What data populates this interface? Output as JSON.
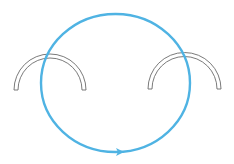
{
  "diagram": {
    "type": "physics-field-loop",
    "colors": {
      "background": "#ffffff",
      "loop": "#4fb3e3",
      "conductor_stroke": "#6b6b6b",
      "conductor_fill": "#ffffff"
    },
    "loop": {
      "shape": "ellipse",
      "cx": 115.5,
      "cy": 83,
      "rx": 74.5,
      "ry": 69,
      "stroke_width": 2.4,
      "arrow": {
        "x": 119,
        "y": 152,
        "direction": "right"
      }
    },
    "conductors": [
      {
        "name": "left-semicircular-conductor",
        "cx": 50,
        "cy": 90,
        "r_outer": 36,
        "r_inner": 32
      },
      {
        "name": "right-semicircular-conductor",
        "cx": 184.5,
        "cy": 89,
        "r_outer": 36.5,
        "r_inner": 32.5
      }
    ]
  }
}
